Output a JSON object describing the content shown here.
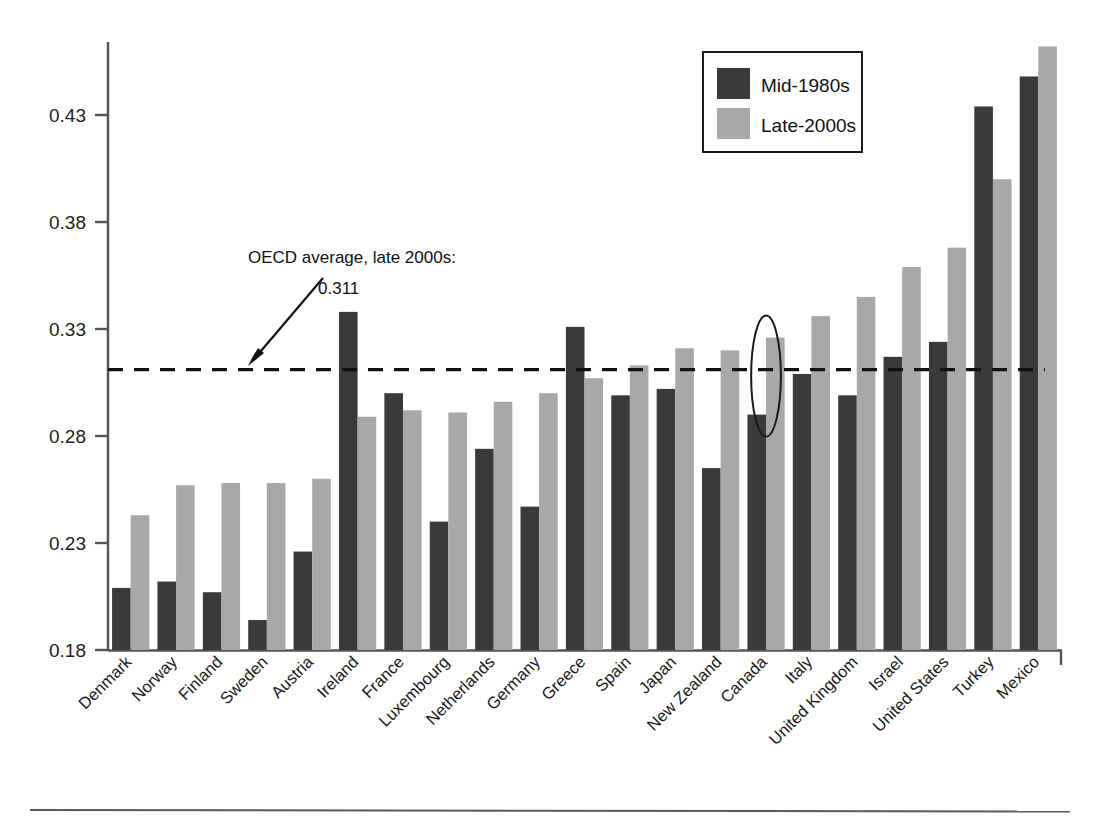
{
  "chart_data": {
    "type": "bar",
    "title": "",
    "subtitle": "",
    "xlabel": "",
    "ylabel": "",
    "ylim": [
      0.18,
      0.47
    ],
    "yticks": [
      0.18,
      0.23,
      0.28,
      0.33,
      0.38,
      0.43
    ],
    "ytick_labels": [
      "0.18",
      "0.23",
      "0.28",
      "0.33",
      "0.38",
      "0.43"
    ],
    "grid": false,
    "legend_position": "top-right",
    "categories": [
      "Denmark",
      "Norway",
      "Finland",
      "Sweden",
      "Austria",
      "Ireland",
      "France",
      "Luxembourg",
      "Netherlands",
      "Germany",
      "Greece",
      "Spain",
      "Japan",
      "New Zealand",
      "Canada",
      "Italy",
      "United Kingdom",
      "Israel",
      "United States",
      "Turkey",
      "Mexico"
    ],
    "series": [
      {
        "name": "Mid-1980s",
        "color": "#3a3a3a",
        "values": [
          0.209,
          0.212,
          0.207,
          0.194,
          0.226,
          0.338,
          0.3,
          0.24,
          0.274,
          0.247,
          0.331,
          0.299,
          0.302,
          0.265,
          0.29,
          0.309,
          0.299,
          0.317,
          0.324,
          0.434,
          0.448
        ]
      },
      {
        "name": "Late-2000s",
        "color": "#a8a8a8",
        "values": [
          0.243,
          0.257,
          0.258,
          0.258,
          0.26,
          0.289,
          0.292,
          0.291,
          0.296,
          0.3,
          0.307,
          0.313,
          0.321,
          0.32,
          0.326,
          0.336,
          0.345,
          0.359,
          0.368,
          0.4,
          0.462
        ]
      }
    ],
    "reference_line": {
      "value": 0.311,
      "style": "dashed",
      "label_line1": "OECD average, late 2000s:",
      "label_line2": "0.311"
    },
    "highlight": {
      "shape": "ellipse",
      "category": "Canada",
      "note": ""
    }
  },
  "legend": {
    "items": [
      {
        "label": "Mid-1980s",
        "color": "#3a3a3a"
      },
      {
        "label": "Late-2000s",
        "color": "#a8a8a8"
      }
    ]
  },
  "annotation": {
    "line1": "OECD average, late 2000s:",
    "line2": "0.311"
  },
  "axis": {
    "y_labels": [
      "0.43",
      "0.38",
      "0.33",
      "0.28",
      "0.23",
      "0.18"
    ]
  },
  "colors": {
    "series_dark": "#3a3a3a",
    "series_light": "#a8a8a8",
    "axis": "#555555",
    "text": "#1a1a1a"
  }
}
